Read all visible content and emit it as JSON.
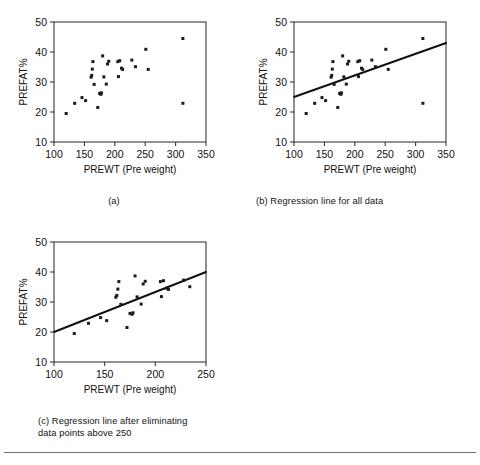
{
  "figure": {
    "panels": [
      {
        "id": "a",
        "caption": "(a)",
        "has_regression": false
      },
      {
        "id": "b",
        "caption": "(b) Regression line for all data",
        "has_regression": true
      },
      {
        "id": "c",
        "caption": "(c) Regression line after eliminating\ndata points above 250",
        "has_regression": true
      }
    ]
  },
  "chart_data": [
    {
      "type": "scatter",
      "panel": "a",
      "title": "(a)",
      "xlabel": "PREWT (Pre weight)",
      "ylabel": "PREFAT%",
      "xlim": [
        100,
        350
      ],
      "ylim": [
        10,
        50
      ],
      "xticks": [
        100,
        150,
        200,
        250,
        300,
        350
      ],
      "yticks": [
        10,
        20,
        30,
        40,
        50
      ],
      "grid": false,
      "legend": "none",
      "marker": "square",
      "marker_color": "#1b1b1b",
      "points": [
        {
          "x": 120,
          "y": 19.5
        },
        {
          "x": 134,
          "y": 22.9
        },
        {
          "x": 146,
          "y": 24.8
        },
        {
          "x": 152,
          "y": 23.8
        },
        {
          "x": 161,
          "y": 31.6
        },
        {
          "x": 162,
          "y": 32.2
        },
        {
          "x": 163,
          "y": 34.3
        },
        {
          "x": 164,
          "y": 36.8
        },
        {
          "x": 166,
          "y": 29.2
        },
        {
          "x": 172,
          "y": 21.5
        },
        {
          "x": 175,
          "y": 26.2
        },
        {
          "x": 177,
          "y": 25.9
        },
        {
          "x": 178,
          "y": 26.4
        },
        {
          "x": 180,
          "y": 38.7
        },
        {
          "x": 182,
          "y": 31.7
        },
        {
          "x": 186,
          "y": 29.3
        },
        {
          "x": 188,
          "y": 36.0
        },
        {
          "x": 190,
          "y": 36.9
        },
        {
          "x": 205,
          "y": 36.8
        },
        {
          "x": 206,
          "y": 31.8
        },
        {
          "x": 208,
          "y": 37.1
        },
        {
          "x": 211,
          "y": 34.6
        },
        {
          "x": 213,
          "y": 34.2
        },
        {
          "x": 228,
          "y": 37.3
        },
        {
          "x": 234,
          "y": 35.1
        },
        {
          "x": 251,
          "y": 40.9
        },
        {
          "x": 255,
          "y": 34.2
        },
        {
          "x": 312,
          "y": 44.5
        },
        {
          "x": 312,
          "y": 22.9
        }
      ]
    },
    {
      "type": "scatter",
      "panel": "b",
      "title": "(b) Regression line for all data",
      "xlabel": "PREWT (Pre weight)",
      "ylabel": "PREFAT%",
      "xlim": [
        100,
        350
      ],
      "ylim": [
        10,
        50
      ],
      "xticks": [
        100,
        150,
        200,
        250,
        300,
        350
      ],
      "yticks": [
        10,
        20,
        30,
        40,
        50
      ],
      "grid": false,
      "legend": "none",
      "marker": "square",
      "marker_color": "#1b1b1b",
      "points": [
        {
          "x": 120,
          "y": 19.5
        },
        {
          "x": 134,
          "y": 22.9
        },
        {
          "x": 146,
          "y": 24.8
        },
        {
          "x": 152,
          "y": 23.8
        },
        {
          "x": 161,
          "y": 31.6
        },
        {
          "x": 162,
          "y": 32.2
        },
        {
          "x": 163,
          "y": 34.3
        },
        {
          "x": 164,
          "y": 36.8
        },
        {
          "x": 166,
          "y": 29.2
        },
        {
          "x": 172,
          "y": 21.5
        },
        {
          "x": 175,
          "y": 26.2
        },
        {
          "x": 177,
          "y": 25.9
        },
        {
          "x": 178,
          "y": 26.4
        },
        {
          "x": 180,
          "y": 38.7
        },
        {
          "x": 182,
          "y": 31.7
        },
        {
          "x": 186,
          "y": 29.3
        },
        {
          "x": 188,
          "y": 36.0
        },
        {
          "x": 190,
          "y": 36.9
        },
        {
          "x": 205,
          "y": 36.8
        },
        {
          "x": 206,
          "y": 31.8
        },
        {
          "x": 208,
          "y": 37.1
        },
        {
          "x": 211,
          "y": 34.6
        },
        {
          "x": 213,
          "y": 34.2
        },
        {
          "x": 228,
          "y": 37.3
        },
        {
          "x": 234,
          "y": 35.1
        },
        {
          "x": 251,
          "y": 40.9
        },
        {
          "x": 255,
          "y": 34.2
        },
        {
          "x": 312,
          "y": 44.5
        },
        {
          "x": 312,
          "y": 22.9
        }
      ],
      "regression_line": {
        "x": [
          100,
          350
        ],
        "y": [
          25.0,
          43.0
        ],
        "color": "#111111"
      }
    },
    {
      "type": "scatter",
      "panel": "c",
      "title": "(c) Regression line after eliminating data points above 250",
      "xlabel": "PREWT (Pre weight)",
      "ylabel": "PREFAT%",
      "xlim": [
        100,
        250
      ],
      "ylim": [
        10,
        50
      ],
      "xticks": [
        100,
        150,
        200,
        250
      ],
      "yticks": [
        10,
        20,
        30,
        40,
        50
      ],
      "grid": false,
      "legend": "none",
      "marker": "square",
      "marker_color": "#1b1b1b",
      "points": [
        {
          "x": 120,
          "y": 19.5
        },
        {
          "x": 134,
          "y": 22.9
        },
        {
          "x": 146,
          "y": 24.8
        },
        {
          "x": 152,
          "y": 23.8
        },
        {
          "x": 161,
          "y": 31.6
        },
        {
          "x": 162,
          "y": 32.2
        },
        {
          "x": 163,
          "y": 34.3
        },
        {
          "x": 164,
          "y": 36.8
        },
        {
          "x": 166,
          "y": 29.2
        },
        {
          "x": 172,
          "y": 21.5
        },
        {
          "x": 175,
          "y": 26.2
        },
        {
          "x": 177,
          "y": 25.9
        },
        {
          "x": 178,
          "y": 26.4
        },
        {
          "x": 180,
          "y": 38.7
        },
        {
          "x": 182,
          "y": 31.7
        },
        {
          "x": 186,
          "y": 29.3
        },
        {
          "x": 188,
          "y": 36.0
        },
        {
          "x": 190,
          "y": 36.9
        },
        {
          "x": 205,
          "y": 36.8
        },
        {
          "x": 206,
          "y": 31.8
        },
        {
          "x": 208,
          "y": 37.1
        },
        {
          "x": 211,
          "y": 34.6
        },
        {
          "x": 213,
          "y": 34.2
        },
        {
          "x": 228,
          "y": 37.3
        },
        {
          "x": 234,
          "y": 35.1
        }
      ],
      "regression_line": {
        "x": [
          100,
          250
        ],
        "y": [
          20.0,
          40.0
        ],
        "color": "#111111"
      }
    }
  ]
}
